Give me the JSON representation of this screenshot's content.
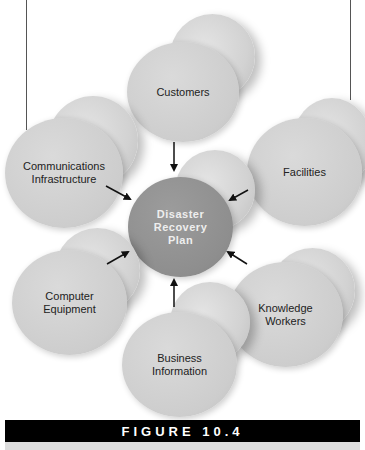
{
  "diagram": {
    "center": {
      "label": "Disaster\nRecovery\nPlan",
      "color": "#8e8e8e"
    },
    "nodes": [
      {
        "id": "customers",
        "label": "Customers"
      },
      {
        "id": "facilities",
        "label": "Facilities"
      },
      {
        "id": "knowledge-workers",
        "label": "Knowledge\nWorkers"
      },
      {
        "id": "business-information",
        "label": "Business\nInformation"
      },
      {
        "id": "computer-equipment",
        "label": "Computer\nEquipment"
      },
      {
        "id": "communications-infrastructure",
        "label": "Communications\nInfrastructure"
      }
    ],
    "node_color": "#cdcdcd"
  },
  "caption": {
    "label": "FIGURE 10.4",
    "bar_color": "#000000"
  }
}
